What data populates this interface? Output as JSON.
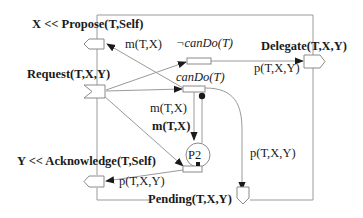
{
  "diagram": {
    "nodes": {
      "propose": {
        "label": "X << Propose(T,Self)",
        "shape": "pentagon-left"
      },
      "request": {
        "label": "Request(T,X,Y)",
        "shape": "notched-flag"
      },
      "not_can_do": {
        "label": "¬canDo(T)",
        "shape": "rectangle"
      },
      "can_do": {
        "label": "canDo(T)",
        "shape": "rectangle"
      },
      "delegate": {
        "label": "Delegate(T,X,Y)",
        "shape": "pentagon-right"
      },
      "p2": {
        "label": "P2",
        "shape": "circle"
      },
      "acknowledge": {
        "label": "Y << Acknowledge(T,Self)",
        "shape": "pentagon-left"
      },
      "pending": {
        "label": "Pending(T,X,Y)",
        "shape": "pentagon-down"
      },
      "join": {
        "label": "",
        "shape": "rectangle"
      }
    },
    "edge_labels": {
      "m_tx_propose": "m(T,X)",
      "p_txy_delegate": "p(T,X,Y)",
      "m_tx_cando": "m(T,X)",
      "m_tx_bold": "m(T,X)",
      "p_txy_ack": "p(T,X,Y)",
      "p_txy_pending": "p(T,X,Y)"
    },
    "colors": {
      "line": "#9a9a9a",
      "text": "#1a1a1a",
      "arrowhead": "#1a1a1a"
    }
  }
}
